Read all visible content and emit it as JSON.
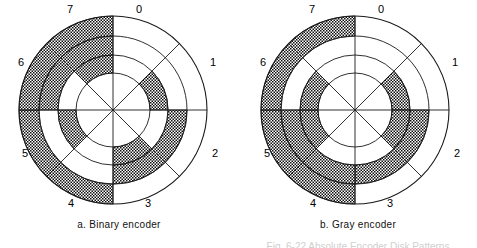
{
  "figure": {
    "panels": [
      {
        "id": "binary",
        "caption": "a. Binary encoder",
        "center": {
          "x": 113,
          "y": 110
        },
        "radii": [
          94,
          74,
          55,
          37
        ],
        "sector_labels": [
          "0",
          "1",
          "2",
          "3",
          "4",
          "5",
          "6",
          "7"
        ],
        "label_positions": [
          {
            "x": 131,
            "y": 4
          },
          {
            "x": 205,
            "y": 57
          },
          {
            "x": 207,
            "y": 148
          },
          {
            "x": 140,
            "y": 198
          },
          {
            "x": 63,
            "y": 198
          },
          {
            "x": 17,
            "y": 148
          },
          {
            "x": 13,
            "y": 57
          },
          {
            "x": 62,
            "y": 4
          }
        ],
        "tracks": [
          {
            "name": "outer-track",
            "bits": [
              0,
              0,
              0,
              0,
              1,
              1,
              1,
              1
            ]
          },
          {
            "name": "middle-track",
            "bits": [
              0,
              0,
              1,
              1,
              0,
              0,
              1,
              1
            ]
          },
          {
            "name": "inner-track",
            "bits": [
              0,
              1,
              0,
              1,
              0,
              1,
              0,
              1
            ]
          }
        ]
      },
      {
        "id": "gray",
        "caption": "b. Gray encoder",
        "center": {
          "x": 116,
          "y": 110
        },
        "radii": [
          94,
          74,
          55,
          37
        ],
        "sector_labels": [
          "0",
          "1",
          "2",
          "3",
          "4",
          "5",
          "6",
          "7"
        ],
        "label_positions": [
          {
            "x": 134,
            "y": 4
          },
          {
            "x": 208,
            "y": 57
          },
          {
            "x": 210,
            "y": 148
          },
          {
            "x": 143,
            "y": 198
          },
          {
            "x": 66,
            "y": 198
          },
          {
            "x": 20,
            "y": 148
          },
          {
            "x": 16,
            "y": 57
          },
          {
            "x": 65,
            "y": 4
          }
        ],
        "tracks": [
          {
            "name": "outer-track",
            "bits": [
              0,
              0,
              0,
              0,
              1,
              1,
              1,
              1
            ]
          },
          {
            "name": "middle-track",
            "bits": [
              0,
              0,
              1,
              1,
              1,
              1,
              0,
              0
            ]
          },
          {
            "name": "inner-track",
            "bits": [
              0,
              1,
              1,
              0,
              0,
              1,
              1,
              0
            ]
          }
        ]
      }
    ],
    "cut_off_line": "Fig. 6-22 Absolute Encoder Disk Patterns"
  },
  "style": {
    "line_color": "#1a1a1a",
    "fill_pattern_color": "#101010",
    "background": "#ffffff"
  }
}
